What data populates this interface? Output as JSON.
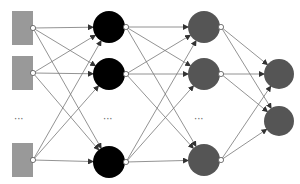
{
  "diagram": {
    "type": "feedforward-neural-network",
    "colors": {
      "input": "#999999",
      "hidden1": "#000000",
      "hidden2": "#555555",
      "output": "#555555",
      "edge": "#777777",
      "port": "#ffffff"
    },
    "layers": [
      {
        "name": "input",
        "shape": "square",
        "x": 22,
        "nodes": [
          28,
          73,
          160
        ],
        "port_x": 33
      },
      {
        "name": "hidden1",
        "shape": "circle",
        "x": 109,
        "r": 16,
        "nodes": [
          27,
          74,
          162
        ],
        "port_x": 126
      },
      {
        "name": "hidden2",
        "shape": "circle",
        "x": 204,
        "r": 16,
        "nodes": [
          27,
          74,
          160
        ],
        "port_x": 221
      },
      {
        "name": "output",
        "shape": "circle",
        "x": 279,
        "r": 15,
        "nodes": [
          74,
          121
        ]
      }
    ],
    "ellipses": [
      {
        "text": "···",
        "x": 14,
        "y": 114
      },
      {
        "text": "···",
        "x": 103,
        "y": 114
      },
      {
        "text": "···",
        "x": 194,
        "y": 114
      }
    ]
  }
}
